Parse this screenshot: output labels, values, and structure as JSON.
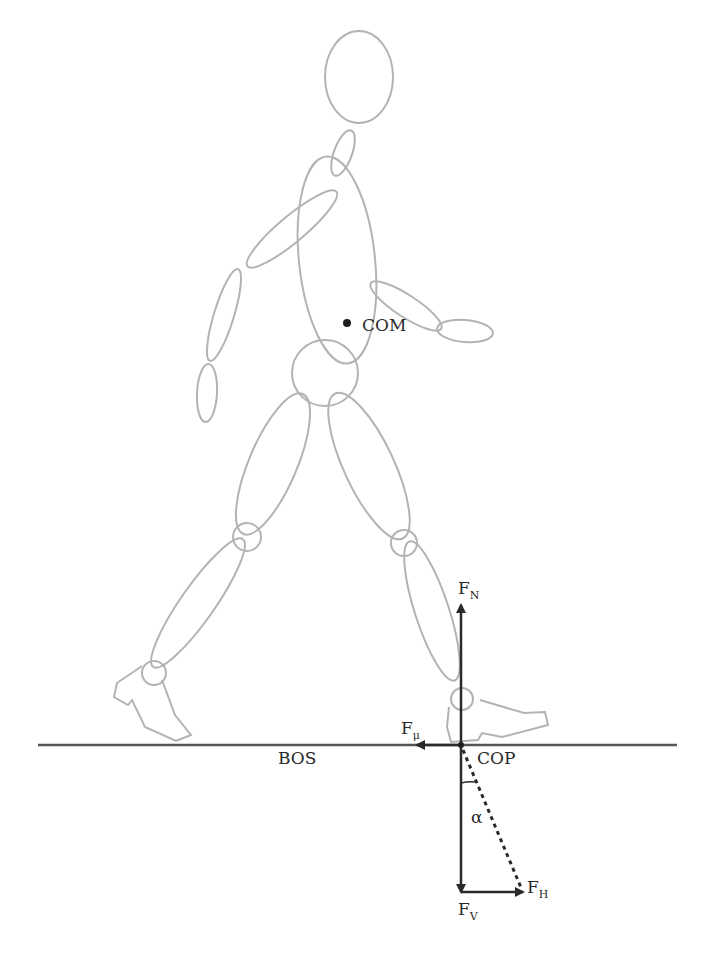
{
  "figure": {
    "labels": {
      "com": "COM",
      "bos": "BOS",
      "cop": "COP",
      "alpha": "α",
      "fn": {
        "main": "F",
        "sub": "N"
      },
      "fmu": {
        "main": "F",
        "sub": "μ"
      },
      "fv": {
        "main": "F",
        "sub": "V"
      },
      "fh": {
        "main": "F",
        "sub": "H"
      }
    },
    "colors": {
      "body_outline": "#b3b3b3",
      "force_vectors": "#2a2a2a",
      "ground_line": "#555555",
      "background": "#ffffff"
    }
  }
}
